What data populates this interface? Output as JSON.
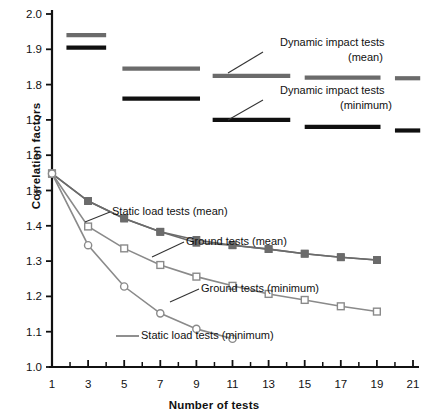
{
  "chart_data": {
    "type": "line",
    "title": "",
    "xlabel": "Number of tests",
    "ylabel": "Correlation factors",
    "xlim": [
      1,
      21
    ],
    "ylim": [
      1.0,
      2.0
    ],
    "xticks": [
      1,
      3,
      5,
      7,
      9,
      11,
      13,
      15,
      17,
      19,
      21
    ],
    "xtick_labels": [
      "1",
      "3",
      "5",
      "7",
      "9",
      "11",
      "13",
      "15",
      "17",
      "19",
      "21"
    ],
    "xminor_ticks": [
      2,
      4,
      6,
      8,
      10,
      12,
      14,
      16,
      18,
      20
    ],
    "yticks": [
      1.0,
      1.1,
      1.2,
      1.3,
      1.4,
      1.5,
      1.6,
      1.7,
      1.8,
      1.9,
      2.0
    ],
    "ytick_labels": [
      "1.0",
      "1.1",
      "1.2",
      "1.3",
      "1.4",
      "1.5",
      "1.6",
      "1.7",
      "1.8",
      "1.9",
      "2.0"
    ],
    "grid": false,
    "legend": "annotations",
    "series": [
      {
        "name": "Static load tests (mean)",
        "style": "line-marker",
        "marker": "filled-square",
        "color": "#6b6b6b",
        "x": [
          1,
          3,
          5,
          7,
          9,
          11,
          13,
          15,
          17,
          19
        ],
        "y": [
          1.548,
          1.47,
          1.421,
          1.383,
          1.352,
          1.345,
          1.334,
          1.321,
          1.311,
          1.303
        ]
      },
      {
        "name": "Ground tests (mean)",
        "style": "line-marker",
        "marker": "filled-square",
        "color": "#6b6b6b",
        "x": [
          1,
          3,
          5,
          7,
          9,
          11,
          13,
          15,
          17,
          19
        ],
        "y": [
          1.548,
          1.47,
          1.421,
          1.383,
          1.36,
          1.345,
          1.334,
          1.321,
          1.311,
          1.303
        ]
      },
      {
        "name": "Ground tests (minimum)",
        "style": "line-marker",
        "marker": "open-square",
        "color": "#8a8a8a",
        "x": [
          1,
          3,
          5,
          7,
          9,
          11,
          13,
          15,
          17,
          19
        ],
        "y": [
          1.548,
          1.398,
          1.336,
          1.289,
          1.256,
          1.23,
          1.207,
          1.19,
          1.172,
          1.157
        ]
      },
      {
        "name": "Static load tests (minimum)",
        "style": "line-marker",
        "marker": "open-circle",
        "color": "#8a8a8a",
        "x": [
          1,
          3,
          5,
          7,
          9,
          11
        ],
        "y": [
          1.548,
          1.345,
          1.228,
          1.152,
          1.108,
          1.08
        ]
      }
    ],
    "step_bars": [
      {
        "name": "Dynamic impact tests (mean)",
        "color": "#6b6b6b",
        "segments": [
          {
            "x0": 1.8,
            "x1": 4.0,
            "y": 1.94
          },
          {
            "x0": 4.9,
            "x1": 9.2,
            "y": 1.845
          },
          {
            "x0": 9.9,
            "x1": 14.2,
            "y": 1.825
          },
          {
            "x0": 15.0,
            "x1": 19.2,
            "y": 1.82
          },
          {
            "x0": 20.0,
            "x1": 21.4,
            "y": 1.818
          }
        ]
      },
      {
        "name": "Dynamic impact tests (minimum)",
        "color": "#101010",
        "segments": [
          {
            "x0": 1.8,
            "x1": 4.0,
            "y": 1.905
          },
          {
            "x0": 4.9,
            "x1": 9.2,
            "y": 1.76
          },
          {
            "x0": 9.9,
            "x1": 14.2,
            "y": 1.7
          },
          {
            "x0": 15.0,
            "x1": 19.2,
            "y": 1.68
          },
          {
            "x0": 20.0,
            "x1": 21.4,
            "y": 1.67
          }
        ]
      }
    ],
    "annotations": [
      {
        "id": "ann-dyn-mean-l1",
        "text": "Dynamic impact tests",
        "x": 280,
        "y": 46,
        "anchor": "start"
      },
      {
        "id": "ann-dyn-mean-l2",
        "text": "(mean)",
        "x": 348,
        "y": 61,
        "anchor": "start"
      },
      {
        "id": "ann-dyn-min-l1",
        "text": "Dynamic impact tests",
        "x": 280,
        "y": 94,
        "anchor": "start"
      },
      {
        "id": "ann-dyn-min-l2",
        "text": "(minimum)",
        "x": 340,
        "y": 109,
        "anchor": "start"
      },
      {
        "id": "ann-static-mean",
        "text": "Static load tests (mean)",
        "x": 112,
        "y": 215,
        "anchor": "start"
      },
      {
        "id": "ann-ground-mean",
        "text": "Ground tests (mean)",
        "x": 186,
        "y": 245,
        "anchor": "start"
      },
      {
        "id": "ann-ground-min",
        "text": "Ground tests (minimum)",
        "x": 201,
        "y": 292,
        "anchor": "start"
      },
      {
        "id": "ann-static-min",
        "text": "Static load tests (minimum)",
        "x": 141,
        "y": 339,
        "anchor": "start"
      }
    ]
  }
}
